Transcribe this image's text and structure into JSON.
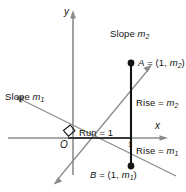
{
  "figure": {
    "type": "geometry-diagram",
    "background_color": "#ffffff",
    "axis_color": "#8c8c8c",
    "line_color": "#8c8c8c",
    "segment_color": "#141414",
    "text_color": "#141414",
    "axes": {
      "x_label": "x",
      "y_label": "y",
      "origin_label": "O",
      "x_tick_label": "1"
    },
    "labels": {
      "slope_m2": {
        "text": "Slope ",
        "sym": "m",
        "sub": "2"
      },
      "slope_m1": {
        "text": "Slope ",
        "sym": "m",
        "sub": "1"
      },
      "point_a": {
        "prefix": "A",
        "eq": " = (1, ",
        "sym": "m",
        "sub": "2",
        "suffix": ")"
      },
      "point_b": {
        "prefix": "B",
        "eq": " = (1, ",
        "sym": "m",
        "sub": "1",
        "suffix": ")"
      },
      "rise_m2": {
        "text": "Rise = ",
        "sym": "m",
        "sub": "2"
      },
      "rise_m1": {
        "text": "Rise = ",
        "sym": "m",
        "sub": "1"
      },
      "run_1": "Run = 1"
    },
    "geometry": {
      "origin": [
        68,
        138
      ],
      "point_a": [
        131,
        63
      ],
      "point_b": [
        131,
        166
      ],
      "x_axis": {
        "from": [
          8,
          138
        ],
        "to": [
          166,
          138
        ]
      },
      "y_axis": {
        "from": [
          73,
          172
        ],
        "to": [
          73,
          12
        ]
      },
      "line_m2": {
        "from": [
          58,
          179
        ],
        "to": [
          152,
          65
        ]
      },
      "line_m1": {
        "from": [
          14,
          96
        ],
        "to": [
          176,
          176
        ]
      }
    }
  }
}
